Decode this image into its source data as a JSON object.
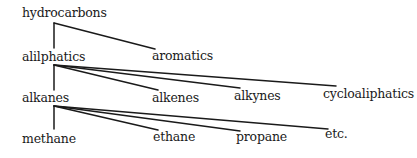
{
  "diagram": {
    "type": "tree",
    "nodes": [
      {
        "id": "hydrocarbons",
        "label": "hydrocarbons",
        "x": 22,
        "y": 6
      },
      {
        "id": "alilphatics",
        "label": "alilphatics",
        "x": 22,
        "y": 50
      },
      {
        "id": "aromatics",
        "label": "aromatics",
        "x": 152,
        "y": 49
      },
      {
        "id": "alkanes",
        "label": "alkanes",
        "x": 22,
        "y": 91
      },
      {
        "id": "alkenes",
        "label": "alkenes",
        "x": 152,
        "y": 91
      },
      {
        "id": "alkynes",
        "label": "alkynes",
        "x": 234,
        "y": 89
      },
      {
        "id": "cycloaliphatics",
        "label": "cycloaliphatics",
        "x": 323,
        "y": 87
      },
      {
        "id": "methane",
        "label": "methane",
        "x": 22,
        "y": 132
      },
      {
        "id": "ethane",
        "label": "ethane",
        "x": 153,
        "y": 130
      },
      {
        "id": "propane",
        "label": "propane",
        "x": 236,
        "y": 130
      },
      {
        "id": "etc",
        "label": "etc.",
        "x": 325,
        "y": 127
      }
    ],
    "edges": [
      {
        "from": "hydrocarbons",
        "to": "alilphatics",
        "x1": 54,
        "y1": 23,
        "x2": 54,
        "y2": 48
      },
      {
        "from": "hydrocarbons",
        "to": "aromatics",
        "x1": 54,
        "y1": 23,
        "x2": 155,
        "y2": 49
      },
      {
        "from": "alilphatics",
        "to": "alkanes",
        "x1": 54,
        "y1": 65,
        "x2": 54,
        "y2": 90
      },
      {
        "from": "alilphatics",
        "to": "alkenes",
        "x1": 54,
        "y1": 65,
        "x2": 158,
        "y2": 90
      },
      {
        "from": "alilphatics",
        "to": "alkynes",
        "x1": 54,
        "y1": 65,
        "x2": 240,
        "y2": 88
      },
      {
        "from": "alilphatics",
        "to": "cycloaliphatics",
        "x1": 54,
        "y1": 65,
        "x2": 336,
        "y2": 86
      },
      {
        "from": "alkanes",
        "to": "methane",
        "x1": 54,
        "y1": 106,
        "x2": 54,
        "y2": 129
      },
      {
        "from": "alkanes",
        "to": "ethane",
        "x1": 54,
        "y1": 106,
        "x2": 158,
        "y2": 130
      },
      {
        "from": "alkanes",
        "to": "propane",
        "x1": 54,
        "y1": 106,
        "x2": 240,
        "y2": 131
      },
      {
        "from": "alkanes",
        "to": "etc",
        "x1": 54,
        "y1": 106,
        "x2": 328,
        "y2": 129
      }
    ]
  }
}
